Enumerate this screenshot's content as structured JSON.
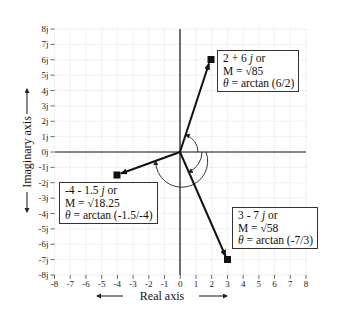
{
  "chart_data": {
    "type": "scatter",
    "title": "",
    "xlabel": "Real axis",
    "ylabel": "Imaginary axis",
    "xlim": [
      -8,
      8
    ],
    "ylim": [
      -8,
      8
    ],
    "grid": true,
    "x_ticks": [
      "-8",
      "-7",
      "-6",
      "-5",
      "-4",
      "-3",
      "-2",
      "-1",
      "0",
      "1",
      "2",
      "3",
      "4",
      "5",
      "6",
      "7",
      "8"
    ],
    "y_ticks": [
      "8j",
      "7j",
      "6j",
      "5j",
      "4j",
      "3j",
      "2j",
      "1j",
      "0j",
      "-1j",
      "-2j",
      "-3j",
      "-4j",
      "-5j",
      "-6j",
      "-7j",
      "-8j"
    ],
    "series": [
      {
        "name": "vectors",
        "points": [
          {
            "real": 2,
            "imag": 6,
            "complex": "2 + 6 j",
            "magnitude": "√85",
            "angle": "arctan (6/2)"
          },
          {
            "real": -4,
            "imag": -1.5,
            "complex": "-4 - 1.5 j",
            "magnitude": "√18.25",
            "angle": "arctan (-1.5/-4)"
          },
          {
            "real": 3,
            "imag": -7,
            "complex": "3 - 7 j",
            "magnitude": "√58",
            "angle": "arctan (-7/3)"
          }
        ]
      }
    ]
  },
  "axes": {
    "x_label": "Real axis",
    "y_label": "Imaginary axis"
  },
  "annotations": [
    {
      "line1_prefix": "2 + 6 ",
      "line1_j": "j",
      "line1_suffix": " or",
      "line2": "M = √85",
      "line3_theta": "θ",
      "line3": " =  arctan (6/2)"
    },
    {
      "line1_prefix": "-4 - 1.5 ",
      "line1_j": "j",
      "line1_suffix": " or",
      "line2": "M = √18.25",
      "line3_theta": "θ",
      "line3": " =  arctan (-1.5/-4)"
    },
    {
      "line1_prefix": "3 - 7 ",
      "line1_j": "j",
      "line1_suffix": " or",
      "line2": "M = √58",
      "line3_theta": "θ",
      "line3": " =  arctan (-7/3)"
    }
  ],
  "colors": {
    "axis": "#111111",
    "grid": "#d8d8d8",
    "vector": "#111111",
    "marker": "#111111"
  }
}
